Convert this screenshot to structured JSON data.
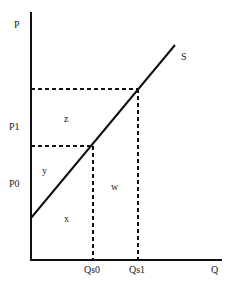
{
  "diagram": {
    "type": "supply-curve",
    "axes": {
      "y_label": "P",
      "x_label": "Q"
    },
    "curve_label": "S",
    "price_labels": [
      "P1",
      "P0"
    ],
    "quantity_labels": [
      "Qs0",
      "Qs1"
    ],
    "area_labels": {
      "z": "z",
      "y": "y",
      "w": "w",
      "x": "x"
    }
  }
}
